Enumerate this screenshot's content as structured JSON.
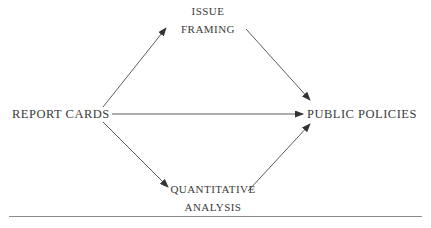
{
  "diagram": {
    "type": "flow-diagram",
    "title": "",
    "background_color": "#ffffff",
    "line_color": "#4a4a4a",
    "text_color": "#3a3a3a",
    "nodes": [
      {
        "id": "report-cards",
        "label": "REPORT CARDS",
        "lines": [
          "REPORT CARDS"
        ],
        "position": "left"
      },
      {
        "id": "issue-framing",
        "label": "ISSUE FRAMING",
        "lines": [
          "ISSUE",
          "FRAMING"
        ],
        "position": "top-center"
      },
      {
        "id": "quantitative-analysis",
        "label": "QUANTITATIVE ANALYSIS",
        "lines": [
          "QUANTITATIVE",
          "ANALYSIS"
        ],
        "position": "bottom-center"
      },
      {
        "id": "public-policies",
        "label": "PUBLIC POLICIES",
        "lines": [
          "PUBLIC POLICIES"
        ],
        "position": "right"
      }
    ],
    "edges": [
      {
        "id": "report-cards-to-issue-framing",
        "from": "REPORT CARDS",
        "to": "ISSUE FRAMING",
        "style": "arrow"
      },
      {
        "id": "issue-framing-to-public-policies",
        "from": "ISSUE FRAMING",
        "to": "PUBLIC POLICIES",
        "style": "arrow"
      },
      {
        "id": "report-cards-to-public-policies",
        "from": "REPORT CARDS",
        "to": "PUBLIC POLICIES",
        "style": "arrow"
      },
      {
        "id": "report-cards-to-quantitative-analysis",
        "from": "REPORT CARDS",
        "to": "QUANTITATIVE ANALYSIS",
        "style": "arrow"
      },
      {
        "id": "quantitative-analysis-to-public-policies",
        "from": "QUANTITATIVE ANALYSIS",
        "to": "PUBLIC POLICIES",
        "style": "arrow"
      }
    ],
    "footer_rule": true
  }
}
